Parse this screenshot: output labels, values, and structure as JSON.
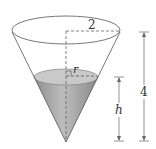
{
  "diagram": {
    "labels": {
      "top_radius": "2",
      "height": "4",
      "liquid_radius": "r",
      "liquid_height": "h"
    },
    "colors": {
      "liquid": "#a9a9a9",
      "liquid_surface": "#c8c8c8",
      "outline": "#555555",
      "dashes": "#666666"
    }
  }
}
